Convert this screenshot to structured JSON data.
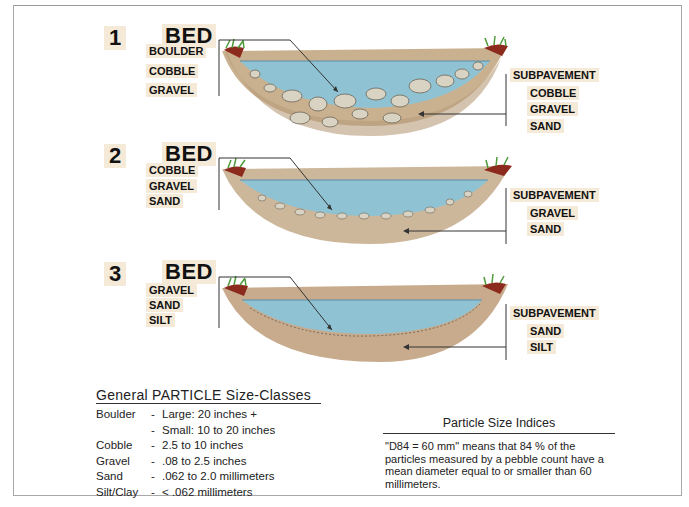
{
  "panels": [
    {
      "number": "1",
      "bed_title": "BED",
      "bed_materials": [
        "BOULDER",
        "COBBLE",
        "GRAVEL"
      ],
      "subpavement_title": "SUBPAVEMENT",
      "subpavement_materials": [
        "COBBLE",
        "GRAVEL",
        "SAND"
      ]
    },
    {
      "number": "2",
      "bed_title": "BED",
      "bed_materials": [
        "COBBLE",
        "GRAVEL",
        "SAND"
      ],
      "subpavement_title": "SUBPAVEMENT",
      "subpavement_materials": [
        "GRAVEL",
        "SAND"
      ]
    },
    {
      "number": "3",
      "bed_title": "BED",
      "bed_materials": [
        "GRAVEL",
        "SAND",
        "SILT"
      ],
      "subpavement_title": "SUBPAVEMENT",
      "subpavement_materials": [
        "SAND",
        "SILT"
      ]
    }
  ],
  "size_classes": {
    "title": "General  PARTICLE  Size-Classes",
    "rows": [
      {
        "name": "Boulder",
        "dash": "-",
        "value": "Large:  20 inches +"
      },
      {
        "name": "",
        "dash": "-",
        "value": "Small:  10  to  20 inches"
      },
      {
        "name": "Cobble",
        "dash": "-",
        "value": "2.5  to  10 inches"
      },
      {
        "name": "Gravel",
        "dash": "-",
        "value": ".08  to  2.5 inches"
      },
      {
        "name": "Sand",
        "dash": "-",
        "value": ".062  to  2.0 millimeters"
      },
      {
        "name": "Silt/Clay",
        "dash": "-",
        "value": "<  .062 millimeters"
      }
    ]
  },
  "indices": {
    "title": "Particle  Size  Indices",
    "text": "\"D84  =  60 mm\" means that 84 % of the particles measured by a pebble count have a mean diameter equal to or smaller than 60 millimeters."
  },
  "colors": {
    "water": "#8fc3d3",
    "water_edge": "#5a8fa8",
    "gravel": "#cdb79a",
    "stone": "#d9d3c4",
    "grass": "#4f9a3a",
    "soil": "#8c2b1d",
    "label_bg": "#f4ead7"
  }
}
